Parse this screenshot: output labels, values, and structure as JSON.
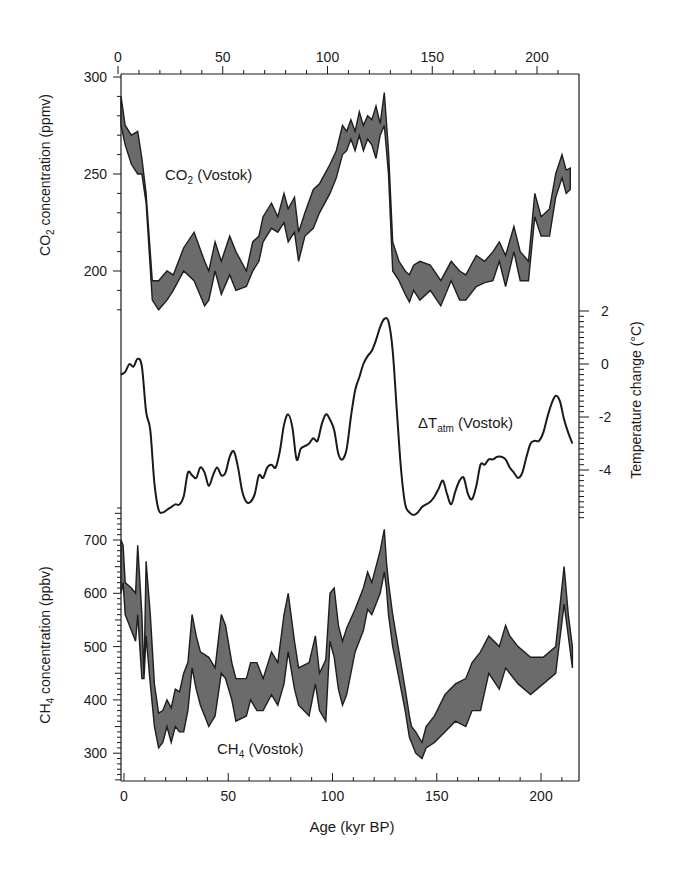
{
  "chart_data": {
    "type": "line",
    "title": "",
    "x_axis": {
      "label": "Age (kyr BP)",
      "range": [
        0,
        220
      ],
      "ticks": [
        0,
        50,
        100,
        150,
        200
      ],
      "minor_tick_step": 10
    },
    "panels": [
      {
        "name": "CO2 (Vostok)",
        "label_main": "CO",
        "label_sub": "2",
        "label_rest": " (Vostok)",
        "ylabel": "CO2 concentration (ppmv)",
        "ylabel_main": "CO",
        "ylabel_sub": "2",
        "ylabel_rest": " concentration (ppmv)",
        "axis_side": "left",
        "ylim": [
          180,
          300
        ],
        "ticks": [
          200,
          250,
          300
        ],
        "style": "band",
        "x": [
          0,
          2,
          5,
          8,
          10,
          12,
          15,
          18,
          22,
          25,
          30,
          35,
          40,
          42,
          45,
          48,
          52,
          55,
          60,
          63,
          66,
          68,
          72,
          75,
          78,
          80,
          83,
          85,
          88,
          92,
          95,
          100,
          103,
          106,
          108,
          110,
          112,
          114,
          116,
          118,
          120,
          122,
          124,
          126,
          128,
          130,
          133,
          136,
          138,
          140,
          143,
          148,
          153,
          158,
          162,
          165,
          170,
          174,
          178,
          181,
          184,
          188,
          191,
          195,
          198,
          201,
          205,
          208,
          211,
          213,
          215
        ],
        "upper": [
          290,
          275,
          270,
          272,
          258,
          240,
          195,
          195,
          200,
          198,
          212,
          220,
          205,
          200,
          215,
          205,
          218,
          210,
          200,
          215,
          218,
          228,
          235,
          228,
          240,
          232,
          238,
          220,
          230,
          242,
          245,
          255,
          262,
          275,
          272,
          278,
          272,
          282,
          275,
          280,
          278,
          285,
          276,
          292,
          262,
          215,
          205,
          200,
          198,
          203,
          205,
          203,
          195,
          205,
          200,
          198,
          208,
          205,
          210,
          215,
          208,
          223,
          210,
          205,
          240,
          228,
          232,
          250,
          260,
          252,
          253
        ],
        "lower": [
          275,
          265,
          255,
          250,
          250,
          235,
          185,
          180,
          185,
          190,
          200,
          195,
          182,
          185,
          200,
          188,
          198,
          190,
          192,
          200,
          205,
          215,
          222,
          220,
          225,
          215,
          220,
          205,
          218,
          222,
          230,
          240,
          248,
          260,
          262,
          268,
          262,
          270,
          262,
          268,
          265,
          258,
          270,
          275,
          250,
          200,
          195,
          188,
          184,
          190,
          185,
          190,
          182,
          195,
          185,
          185,
          192,
          194,
          195,
          205,
          192,
          210,
          195,
          195,
          228,
          218,
          218,
          238,
          248,
          240,
          242
        ]
      },
      {
        "name": "ΔTatm (Vostok)",
        "label_main": "ΔT",
        "label_sub": "atm",
        "label_rest": " (Vostok)",
        "ylabel": "Temperature change (°C)",
        "axis_side": "right",
        "ylim": [
          -5.8,
          2
        ],
        "ticks": [
          2,
          0,
          -2,
          -4
        ],
        "tick_labels": [
          "2",
          "0",
          "-2",
          "-4"
        ],
        "style": "line",
        "x": [
          0,
          2,
          4,
          6,
          8,
          10,
          12,
          14,
          16,
          18,
          20,
          22,
          24,
          26,
          28,
          30,
          32,
          34,
          36,
          38,
          40,
          42,
          44,
          46,
          48,
          50,
          52,
          54,
          56,
          58,
          60,
          62,
          64,
          66,
          68,
          70,
          72,
          74,
          76,
          78,
          80,
          82,
          84,
          86,
          88,
          90,
          92,
          94,
          96,
          98,
          100,
          102,
          104,
          106,
          108,
          110,
          112,
          114,
          116,
          118,
          120,
          122,
          124,
          126,
          128,
          130,
          132,
          134,
          136,
          138,
          140,
          142,
          144,
          146,
          148,
          150,
          152,
          154,
          156,
          158,
          160,
          162,
          164,
          166,
          168,
          170,
          172,
          174,
          176,
          178,
          180,
          182,
          184,
          186,
          188,
          190,
          192,
          194,
          196,
          198,
          200,
          202,
          204,
          206,
          208,
          210,
          212,
          214,
          216
        ],
        "values": [
          -0.4,
          -0.3,
          0.0,
          -0.1,
          0.2,
          -0.1,
          -1.8,
          -2.5,
          -4.5,
          -5.5,
          -5.6,
          -5.5,
          -5.4,
          -5.3,
          -5.3,
          -5.0,
          -4.1,
          -4.2,
          -4.3,
          -3.9,
          -4.1,
          -4.6,
          -4.2,
          -3.9,
          -4.2,
          -4.1,
          -3.5,
          -3.3,
          -3.9,
          -4.8,
          -5.2,
          -5.2,
          -4.9,
          -4.2,
          -4.3,
          -3.9,
          -3.8,
          -3.9,
          -3.3,
          -2.3,
          -1.9,
          -2.4,
          -3.6,
          -3.2,
          -3.1,
          -3.0,
          -2.8,
          -2.9,
          -2.3,
          -1.9,
          -2.1,
          -2.5,
          -3.4,
          -3.6,
          -3.2,
          -2.0,
          -1.0,
          -0.5,
          0.0,
          0.3,
          0.5,
          0.9,
          1.4,
          1.7,
          1.6,
          0.5,
          -1.8,
          -4.0,
          -5.3,
          -5.6,
          -5.7,
          -5.6,
          -5.4,
          -5.3,
          -5.2,
          -5.0,
          -4.7,
          -4.4,
          -4.9,
          -5.3,
          -4.8,
          -4.4,
          -4.3,
          -4.9,
          -5.1,
          -4.6,
          -3.8,
          -3.8,
          -3.6,
          -3.6,
          -3.5,
          -3.5,
          -3.6,
          -3.9,
          -4.1,
          -4.3,
          -4.1,
          -3.5,
          -3.0,
          -2.9,
          -2.9,
          -2.6,
          -2.0,
          -1.5,
          -1.2,
          -1.4,
          -2.1,
          -2.6,
          -3.0
        ]
      },
      {
        "name": "CH4 (Vostok)",
        "label_main": "CH",
        "label_sub": "4",
        "label_rest": " (Vostok)",
        "ylabel": "CH4 concentration (ppbv)",
        "ylabel_main": "CH",
        "ylabel_sub": "4",
        "ylabel_rest": " concentration (ppbv)",
        "axis_side": "left",
        "ylim": [
          250,
          760
        ],
        "ticks": [
          300,
          400,
          500,
          600,
          700
        ],
        "style": "band",
        "x": [
          0,
          1,
          2,
          5,
          7,
          8,
          10,
          11,
          12,
          14,
          16,
          18,
          20,
          22,
          24,
          26,
          28,
          30,
          32,
          34,
          36,
          38,
          42,
          45,
          48,
          50,
          53,
          55,
          60,
          62,
          65,
          68,
          72,
          75,
          78,
          80,
          83,
          85,
          90,
          93,
          95,
          98,
          100,
          102,
          104,
          106,
          108,
          112,
          116,
          118,
          120,
          124,
          126,
          127,
          128,
          130,
          133,
          136,
          138,
          139,
          141,
          144,
          146,
          150,
          155,
          160,
          165,
          168,
          172,
          176,
          181,
          184,
          186,
          190,
          196,
          202,
          208,
          212,
          214,
          216
        ],
        "upper": [
          700,
          690,
          620,
          610,
          600,
          690,
          560,
          440,
          660,
          560,
          430,
          375,
          380,
          400,
          385,
          420,
          415,
          450,
          470,
          560,
          520,
          490,
          480,
          460,
          560,
          540,
          470,
          440,
          440,
          470,
          470,
          440,
          490,
          470,
          560,
          600,
          510,
          460,
          470,
          520,
          450,
          475,
          600,
          610,
          540,
          510,
          535,
          570,
          610,
          640,
          620,
          680,
          720,
          660,
          620,
          560,
          490,
          420,
          370,
          350,
          340,
          320,
          350,
          370,
          410,
          430,
          440,
          470,
          490,
          520,
          500,
          540,
          520,
          500,
          480,
          480,
          500,
          650,
          560,
          500
        ],
        "lower": [
          600,
          620,
          560,
          530,
          510,
          560,
          440,
          440,
          520,
          430,
          350,
          310,
          320,
          350,
          320,
          350,
          340,
          340,
          380,
          460,
          420,
          390,
          350,
          370,
          450,
          440,
          400,
          360,
          370,
          400,
          380,
          380,
          410,
          390,
          430,
          490,
          420,
          390,
          370,
          430,
          380,
          360,
          510,
          480,
          420,
          390,
          410,
          490,
          530,
          570,
          560,
          600,
          640,
          610,
          560,
          500,
          440,
          380,
          330,
          320,
          300,
          290,
          310,
          320,
          340,
          360,
          350,
          380,
          380,
          450,
          420,
          460,
          450,
          430,
          410,
          430,
          450,
          580,
          520,
          460
        ]
      }
    ],
    "legend": null,
    "grid": false
  },
  "labels": {
    "x_axis_title": "Age (kyr BP)",
    "co2_axis_title": "CO2 concentration (ppmv)",
    "temp_axis_title": "Temperature change (°C)",
    "ch4_axis_title": "CH4 concentration (ppbv)",
    "x_tick_labels": [
      "0",
      "50",
      "100",
      "150",
      "200"
    ],
    "co2_tick_labels": [
      "300",
      "250",
      "200"
    ],
    "temp_tick_labels": [
      "2",
      "0",
      "-2",
      "-4"
    ],
    "ch4_tick_labels": [
      "700",
      "600",
      "500",
      "400",
      "300"
    ]
  },
  "colors": {
    "ink": "#1a1a1a",
    "band_fill": "#6b6b6b",
    "band_edge": "#1e1e1e",
    "background": "#ffffff"
  }
}
